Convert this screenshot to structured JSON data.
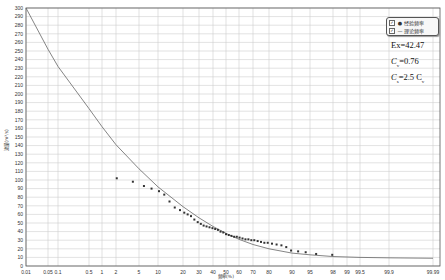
{
  "chart_data": {
    "type": "scatter",
    "title": "",
    "xlabel": "频率(%)",
    "ylabel": "流量(m³/s)",
    "x_scale": "probability",
    "ylim": [
      0,
      300
    ],
    "yticks": [
      0,
      10,
      20,
      30,
      40,
      50,
      60,
      70,
      80,
      90,
      100,
      110,
      120,
      130,
      140,
      150,
      160,
      170,
      180,
      190,
      200,
      210,
      220,
      230,
      240,
      250,
      260,
      270,
      280,
      290,
      300
    ],
    "xticks": [
      "0.01",
      "0.05",
      "0.1",
      "0.5",
      "1",
      "2",
      "5",
      "10",
      "20",
      "30",
      "40",
      "50",
      "60",
      "70",
      "80",
      "90",
      "95",
      "98",
      "99",
      "99.5",
      "99.9",
      "99.99"
    ],
    "grid": true,
    "legend_position": "top-right",
    "series": [
      {
        "name": "经验频率",
        "kind": "scatter",
        "points": [
          [
            2.1,
            102
          ],
          [
            4.2,
            98
          ],
          [
            6.3,
            93
          ],
          [
            8.3,
            90
          ],
          [
            10.4,
            87
          ],
          [
            12.5,
            83
          ],
          [
            14.6,
            75
          ],
          [
            16.7,
            68
          ],
          [
            18.8,
            65
          ],
          [
            20.8,
            62
          ],
          [
            22.9,
            60
          ],
          [
            25.0,
            58
          ],
          [
            27.1,
            54
          ],
          [
            29.2,
            51
          ],
          [
            31.3,
            49
          ],
          [
            33.3,
            47
          ],
          [
            35.4,
            46
          ],
          [
            37.5,
            45
          ],
          [
            39.6,
            44
          ],
          [
            41.7,
            43
          ],
          [
            43.8,
            42
          ],
          [
            45.8,
            40
          ],
          [
            47.9,
            39
          ],
          [
            50.0,
            37
          ],
          [
            52.1,
            36
          ],
          [
            54.2,
            35
          ],
          [
            56.3,
            34
          ],
          [
            58.3,
            34
          ],
          [
            60.4,
            33
          ],
          [
            62.5,
            32
          ],
          [
            64.6,
            31
          ],
          [
            66.7,
            31
          ],
          [
            68.8,
            30
          ],
          [
            70.8,
            30
          ],
          [
            72.9,
            29
          ],
          [
            75.0,
            28
          ],
          [
            77.1,
            27
          ],
          [
            79.2,
            27
          ],
          [
            81.3,
            26
          ],
          [
            83.3,
            25
          ],
          [
            85.4,
            24
          ],
          [
            87.5,
            22
          ],
          [
            89.6,
            18
          ],
          [
            91.7,
            17
          ],
          [
            93.8,
            16
          ],
          [
            95.8,
            14
          ],
          [
            97.9,
            13
          ]
        ]
      },
      {
        "name": "理论频率",
        "kind": "line",
        "points": [
          [
            0.01,
            300
          ],
          [
            0.05,
            252
          ],
          [
            0.1,
            232
          ],
          [
            0.5,
            183
          ],
          [
            1,
            162
          ],
          [
            2,
            141
          ],
          [
            5,
            113
          ],
          [
            10,
            92
          ],
          [
            20,
            69
          ],
          [
            30,
            56
          ],
          [
            40,
            46
          ],
          [
            50,
            38
          ],
          [
            60,
            31
          ],
          [
            70,
            25
          ],
          [
            80,
            20
          ],
          [
            90,
            15
          ],
          [
            95,
            13
          ],
          [
            98,
            11
          ],
          [
            99,
            10.5
          ],
          [
            99.5,
            10
          ],
          [
            99.9,
            9.5
          ],
          [
            99.99,
            9
          ]
        ]
      }
    ],
    "annotations": [
      "Ex=42.47",
      "Cv=0.76",
      "Cs=2.5 Cv"
    ]
  },
  "legend": {
    "items": [
      {
        "label": "经验频率",
        "checked": true,
        "symbol": "●"
      },
      {
        "label": "理论频率",
        "checked": true,
        "symbol": "—"
      }
    ]
  },
  "stats": {
    "ex": "Ex=42.47",
    "cv_prefix": "C",
    "cv_sub": "v",
    "cv_value": "=0.76",
    "cs_prefix": "C",
    "cs_sub": "s",
    "cs_value": "=2.5 C",
    "cs_tail_sub": "v"
  },
  "colors": {
    "grid": "#cfcfcf",
    "axis": "#555555",
    "curve": "#666666",
    "points": "#333333"
  },
  "tick_pixels": {
    "x": [
      26,
      48,
      58,
      89,
      102,
      116,
      139,
      158,
      183,
      199,
      213,
      226,
      239,
      253,
      269,
      292,
      310,
      333,
      347,
      360,
      389,
      433
    ],
    "y0": 266,
    "y300": 8
  }
}
